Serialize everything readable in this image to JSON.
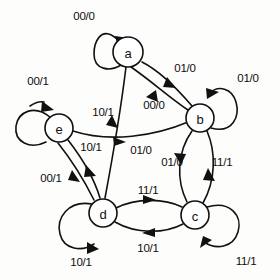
{
  "diagram": {
    "kind": "finite-state-machine",
    "ink_color": "#111111",
    "background_color": "#fdfdfb",
    "states": [
      {
        "id": "a",
        "label": "a",
        "cx": 128,
        "cy": 52,
        "r": 15
      },
      {
        "id": "b",
        "label": "b",
        "cx": 200,
        "cy": 118,
        "r": 14
      },
      {
        "id": "c",
        "label": "c",
        "cx": 195,
        "cy": 215,
        "r": 14
      },
      {
        "id": "d",
        "label": "d",
        "cx": 103,
        "cy": 213,
        "r": 14
      },
      {
        "id": "e",
        "label": "e",
        "cx": 59,
        "cy": 128,
        "r": 14
      }
    ],
    "self_loops": [
      {
        "state": "a",
        "label": "00/0",
        "label_x": 84,
        "label_y": 16
      },
      {
        "state": "b",
        "label": "01/0",
        "label_x": 248,
        "label_y": 78
      },
      {
        "state": "c",
        "label": "11/1",
        "label_x": 246,
        "label_y": 261
      },
      {
        "state": "d",
        "label": "10/1",
        "label_x": 81,
        "label_y": 262
      },
      {
        "state": "e",
        "label": "00/1",
        "label_x": 38,
        "label_y": 81
      }
    ],
    "transitions": [
      {
        "from": "a",
        "to": "b",
        "label": "01/0",
        "label_x": 185,
        "label_y": 68
      },
      {
        "from": "b",
        "to": "a",
        "label": "00/0",
        "label_x": 154,
        "label_y": 105
      },
      {
        "from": "a",
        "to": "d",
        "label": "10/1",
        "label_x": 103,
        "label_y": 112
      },
      {
        "from": "e",
        "to": "b",
        "label": "01/0",
        "label_x": 141,
        "label_y": 150
      },
      {
        "from": "e",
        "to": "d",
        "label": "10/1",
        "label_x": 91,
        "label_y": 147
      },
      {
        "from": "d",
        "to": "e",
        "label": "00/1",
        "label_x": 51,
        "label_y": 178
      },
      {
        "from": "d",
        "to": "c",
        "label": "11/1",
        "label_x": 148,
        "label_y": 190
      },
      {
        "from": "c",
        "to": "d",
        "label": "10/1",
        "label_x": 148,
        "label_y": 248
      },
      {
        "from": "b",
        "to": "c",
        "label": "11/1",
        "label_x": 222,
        "label_y": 162
      },
      {
        "from": "c",
        "to": "b",
        "label": "01/0",
        "label_x": 172,
        "label_y": 162
      }
    ]
  }
}
